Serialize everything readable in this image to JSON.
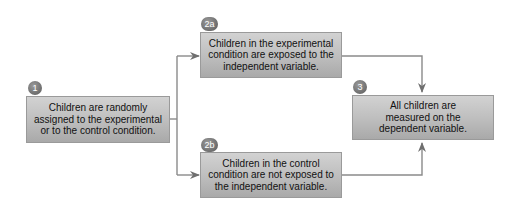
{
  "diagram": {
    "steps": [
      {
        "badge": "1",
        "text": "Children are randomly assigned to the experimental or to the control condition."
      },
      {
        "badge": "2a",
        "text": "Children in the experimental condition are exposed to the independent variable."
      },
      {
        "badge": "2b",
        "text": "Children in the control condition are not exposed to the independent variable."
      },
      {
        "badge": "3",
        "text": "All children are measured on the dependent variable."
      }
    ],
    "connectors": [
      {
        "from": "1",
        "to": "2a"
      },
      {
        "from": "1",
        "to": "2b"
      },
      {
        "from": "2a",
        "to": "3"
      },
      {
        "from": "2b",
        "to": "3"
      }
    ],
    "colors": {
      "box_fill": "#bdbdbd",
      "badge_fill": "#6d6d6d",
      "line": "#7a7a7a"
    }
  }
}
